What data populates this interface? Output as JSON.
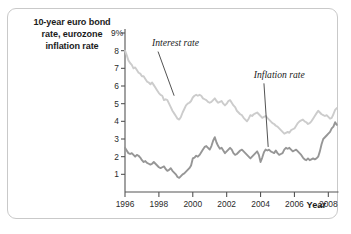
{
  "figure": {
    "title": "10-year euro bond rate, eurozone inflation rate",
    "title_lines": [
      "10-year euro bond",
      "rate, eurozone",
      "inflation rate"
    ],
    "x_axis_label": "Year",
    "colors": {
      "interest_rate_line": "#cccccc",
      "inflation_rate_line": "#969696",
      "axis": "#555555",
      "card_border": "#c9c9c9",
      "background": "#ffffff",
      "text": "#1b1b1b"
    }
  },
  "chart_data": {
    "type": "line",
    "title": "10-year euro bond rate, eurozone inflation rate",
    "xlabel": "Year",
    "ylabel": "10-year euro bond rate, eurozone inflation rate",
    "grid": false,
    "legend_position": "inline-annotations",
    "xlim": [
      1996,
      2008.6
    ],
    "ylim": [
      0,
      9
    ],
    "x_tick_labels": [
      "1996",
      "1998",
      "2000",
      "2002",
      "2004",
      "2006",
      "2008"
    ],
    "x_ticks": [
      1996,
      1998,
      2000,
      2002,
      2004,
      2006,
      2008
    ],
    "y_tick_labels": [
      "9%",
      "8",
      "7",
      "6",
      "5",
      "4",
      "3",
      "2",
      "1"
    ],
    "y_ticks": [
      9,
      8,
      7,
      6,
      5,
      4,
      3,
      2,
      1
    ],
    "annotations": [
      {
        "text": "Interest rate",
        "x": 1997.6,
        "y": 8.35
      },
      {
        "text": "Inflation rate",
        "x": 2003.6,
        "y": 6.55
      }
    ],
    "series": [
      {
        "name": "Interest rate",
        "label": "Interest rate",
        "color": "#cccccc",
        "x": [
          1996.0,
          1996.1,
          1996.2,
          1996.3,
          1996.4,
          1996.5,
          1996.6,
          1996.7,
          1996.8,
          1996.9,
          1997.0,
          1997.1,
          1997.2,
          1997.3,
          1997.4,
          1997.5,
          1997.6,
          1997.7,
          1997.8,
          1997.9,
          1998.0,
          1998.1,
          1998.2,
          1998.3,
          1998.4,
          1998.5,
          1998.6,
          1998.7,
          1998.8,
          1998.9,
          1999.0,
          1999.1,
          1999.2,
          1999.3,
          1999.4,
          1999.5,
          1999.6,
          1999.7,
          1999.8,
          1999.9,
          2000.0,
          2000.1,
          2000.2,
          2000.3,
          2000.4,
          2000.5,
          2000.6,
          2000.7,
          2000.8,
          2000.9,
          2001.0,
          2001.1,
          2001.2,
          2001.3,
          2001.4,
          2001.5,
          2001.6,
          2001.7,
          2001.8,
          2001.9,
          2002.0,
          2002.1,
          2002.2,
          2002.3,
          2002.4,
          2002.5,
          2002.6,
          2002.7,
          2002.8,
          2002.9,
          2003.0,
          2003.1,
          2003.2,
          2003.3,
          2003.4,
          2003.5,
          2003.6,
          2003.7,
          2003.8,
          2003.9,
          2004.0,
          2004.1,
          2004.2,
          2004.3,
          2004.4,
          2004.5,
          2004.6,
          2004.7,
          2004.8,
          2004.9,
          2005.0,
          2005.1,
          2005.2,
          2005.3,
          2005.4,
          2005.5,
          2005.6,
          2005.7,
          2005.8,
          2005.9,
          2006.0,
          2006.1,
          2006.2,
          2006.3,
          2006.4,
          2006.5,
          2006.6,
          2006.7,
          2006.8,
          2006.9,
          2007.0,
          2007.1,
          2007.2,
          2007.3,
          2007.4,
          2007.5,
          2007.6,
          2007.7,
          2007.8,
          2007.9,
          2008.0,
          2008.1,
          2008.2,
          2008.3,
          2008.4,
          2008.5
        ],
        "values": [
          8.0,
          7.75,
          7.45,
          7.3,
          7.2,
          7.0,
          7.05,
          6.9,
          6.75,
          6.7,
          6.55,
          6.55,
          6.4,
          6.25,
          6.2,
          6.1,
          6.2,
          6.05,
          5.9,
          5.75,
          5.6,
          5.5,
          5.45,
          5.2,
          5.25,
          5.2,
          5.0,
          4.8,
          4.6,
          4.45,
          4.3,
          4.15,
          4.1,
          4.25,
          4.5,
          4.7,
          4.9,
          5.0,
          5.05,
          5.15,
          5.35,
          5.45,
          5.5,
          5.45,
          5.5,
          5.45,
          5.3,
          5.25,
          5.2,
          5.1,
          5.05,
          5.1,
          5.2,
          5.3,
          5.15,
          5.05,
          5.1,
          5.15,
          5.0,
          4.9,
          5.0,
          5.15,
          5.2,
          5.05,
          4.9,
          4.8,
          4.6,
          4.5,
          4.4,
          4.35,
          4.2,
          4.1,
          4.0,
          4.15,
          4.35,
          4.3,
          4.4,
          4.45,
          4.5,
          4.4,
          4.3,
          4.2,
          4.25,
          4.3,
          4.2,
          4.1,
          4.0,
          3.9,
          3.85,
          3.75,
          3.7,
          3.6,
          3.5,
          3.4,
          3.3,
          3.35,
          3.4,
          3.35,
          3.5,
          3.55,
          3.6,
          3.75,
          3.9,
          4.0,
          4.05,
          4.1,
          4.0,
          3.95,
          3.85,
          3.9,
          4.0,
          4.15,
          4.3,
          4.45,
          4.6,
          4.5,
          4.4,
          4.35,
          4.3,
          4.35,
          4.25,
          4.15,
          4.2,
          4.4,
          4.65,
          4.75
        ]
      },
      {
        "name": "Inflation rate",
        "label": "Inflation rate",
        "color": "#969696",
        "x": [
          1996.0,
          1996.1,
          1996.2,
          1996.3,
          1996.4,
          1996.5,
          1996.6,
          1996.7,
          1996.8,
          1996.9,
          1997.0,
          1997.1,
          1997.2,
          1997.3,
          1997.4,
          1997.5,
          1997.6,
          1997.7,
          1997.8,
          1997.9,
          1998.0,
          1998.1,
          1998.2,
          1998.3,
          1998.4,
          1998.5,
          1998.6,
          1998.7,
          1998.8,
          1998.9,
          1999.0,
          1999.1,
          1999.2,
          1999.3,
          1999.4,
          1999.5,
          1999.6,
          1999.7,
          1999.8,
          1999.9,
          2000.0,
          2000.1,
          2000.2,
          2000.3,
          2000.4,
          2000.5,
          2000.6,
          2000.7,
          2000.8,
          2000.9,
          2001.0,
          2001.1,
          2001.2,
          2001.3,
          2001.4,
          2001.5,
          2001.6,
          2001.7,
          2001.8,
          2001.9,
          2002.0,
          2002.1,
          2002.2,
          2002.3,
          2002.4,
          2002.5,
          2002.6,
          2002.7,
          2002.8,
          2002.9,
          2003.0,
          2003.1,
          2003.2,
          2003.3,
          2003.4,
          2003.5,
          2003.6,
          2003.7,
          2003.8,
          2003.9,
          2004.0,
          2004.1,
          2004.2,
          2004.3,
          2004.4,
          2004.5,
          2004.6,
          2004.7,
          2004.8,
          2004.9,
          2005.0,
          2005.1,
          2005.2,
          2005.3,
          2005.4,
          2005.5,
          2005.6,
          2005.7,
          2005.8,
          2005.9,
          2006.0,
          2006.1,
          2006.2,
          2006.3,
          2006.4,
          2006.5,
          2006.6,
          2006.7,
          2006.8,
          2006.9,
          2007.0,
          2007.1,
          2007.2,
          2007.3,
          2007.4,
          2007.5,
          2007.6,
          2007.7,
          2007.8,
          2007.9,
          2008.0,
          2008.1,
          2008.2,
          2008.3,
          2008.4,
          2008.5
        ],
        "values": [
          2.5,
          2.35,
          2.2,
          2.15,
          2.2,
          2.1,
          2.0,
          2.1,
          2.05,
          1.95,
          1.8,
          1.7,
          1.75,
          1.65,
          1.6,
          1.55,
          1.6,
          1.7,
          1.6,
          1.5,
          1.4,
          1.35,
          1.4,
          1.45,
          1.3,
          1.2,
          1.25,
          1.35,
          1.2,
          1.1,
          1.0,
          0.85,
          0.8,
          0.9,
          1.0,
          1.05,
          1.15,
          1.25,
          1.35,
          1.5,
          1.9,
          1.95,
          2.05,
          2.0,
          2.1,
          2.25,
          2.4,
          2.55,
          2.6,
          2.5,
          2.4,
          2.6,
          2.9,
          3.1,
          2.8,
          2.6,
          2.45,
          2.5,
          2.35,
          2.2,
          2.3,
          2.4,
          2.5,
          2.4,
          2.2,
          2.1,
          2.15,
          2.25,
          2.35,
          2.4,
          2.3,
          2.2,
          2.1,
          2.0,
          1.9,
          2.0,
          2.1,
          2.2,
          2.3,
          2.1,
          1.7,
          1.95,
          2.25,
          2.4,
          2.35,
          2.4,
          2.3,
          2.25,
          2.2,
          2.35,
          2.2,
          2.1,
          2.15,
          2.2,
          2.4,
          2.5,
          2.45,
          2.5,
          2.4,
          2.3,
          2.35,
          2.4,
          2.3,
          2.2,
          2.1,
          1.95,
          1.85,
          1.8,
          1.9,
          1.8,
          1.85,
          1.9,
          1.85,
          1.9,
          2.0,
          2.3,
          2.7,
          3.0,
          3.1,
          3.2,
          3.3,
          3.4,
          3.6,
          3.7,
          3.95,
          3.8
        ]
      }
    ]
  }
}
